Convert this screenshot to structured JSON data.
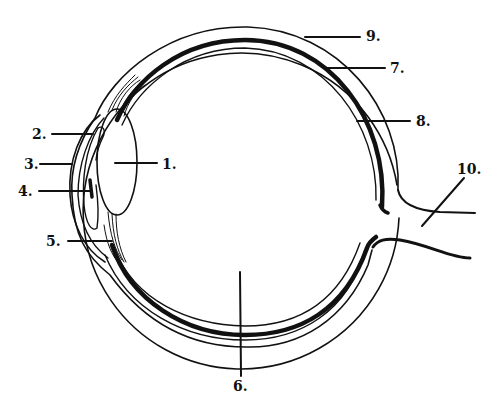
{
  "diagram": {
    "colors": {
      "ink": "#111111",
      "background": "#ffffff"
    },
    "labels": [
      {
        "id": "1",
        "text": "1.",
        "x": 162,
        "y": 158
      },
      {
        "id": "2",
        "text": "2.",
        "x": 32,
        "y": 127
      },
      {
        "id": "3",
        "text": "3.",
        "x": 24,
        "y": 157
      },
      {
        "id": "4",
        "text": "4.",
        "x": 18,
        "y": 184
      },
      {
        "id": "5",
        "text": "5.",
        "x": 46,
        "y": 233
      },
      {
        "id": "6",
        "text": "6.",
        "x": 232,
        "y": 377
      },
      {
        "id": "7",
        "text": "7.",
        "x": 390,
        "y": 63
      },
      {
        "id": "8",
        "text": "8.",
        "x": 416,
        "y": 113
      },
      {
        "id": "9",
        "text": "9.",
        "x": 366,
        "y": 29
      },
      {
        "id": "10",
        "text": "10.",
        "x": 457,
        "y": 161
      }
    ]
  }
}
